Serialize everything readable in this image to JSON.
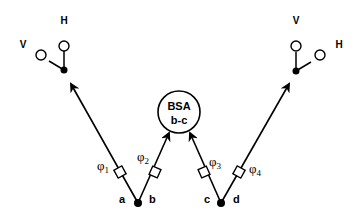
{
  "diagram": {
    "center_node": {
      "line1": "BSA",
      "line2": "b-c"
    },
    "ports": {
      "a": "a",
      "b": "b",
      "c": "c",
      "d": "d"
    },
    "phase_shifters": [
      {
        "symbol": "φ",
        "sub": "1"
      },
      {
        "symbol": "φ",
        "sub": "2"
      },
      {
        "symbol": "φ",
        "sub": "3"
      },
      {
        "symbol": "φ",
        "sub": "4"
      }
    ],
    "left_detector": {
      "v_label": "V",
      "h_label": "H"
    },
    "right_detector": {
      "v_label": "V",
      "h_label": "H"
    },
    "colors": {
      "stroke": "#000000",
      "background": "#ffffff"
    }
  }
}
